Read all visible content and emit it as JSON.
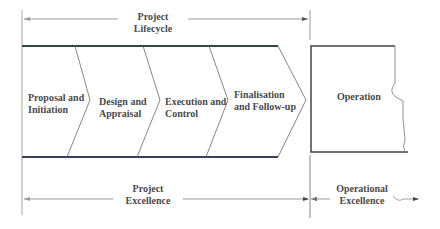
{
  "diagram": {
    "top_span": {
      "label_line1": "Project",
      "label_line2": "Lifecycle"
    },
    "phases": [
      {
        "line1": "Proposal and",
        "line2": "Initiation"
      },
      {
        "line1": "Design and",
        "line2": "Appraisal"
      },
      {
        "line1": "Execution and",
        "line2": "Control"
      },
      {
        "line1": "Finalisation",
        "line2": "and Follow-up"
      }
    ],
    "operation": {
      "label": "Operation"
    },
    "bottom_spans": [
      {
        "label_line1": "Project",
        "label_line2": "Excellence"
      },
      {
        "label_line1": "Operational",
        "label_line2": "Excellence"
      }
    ],
    "colors": {
      "band_top": "#2f5a3a",
      "band_bottom": "#3a3f5c",
      "lines": "#777777",
      "text": "#4a4a4a"
    }
  }
}
